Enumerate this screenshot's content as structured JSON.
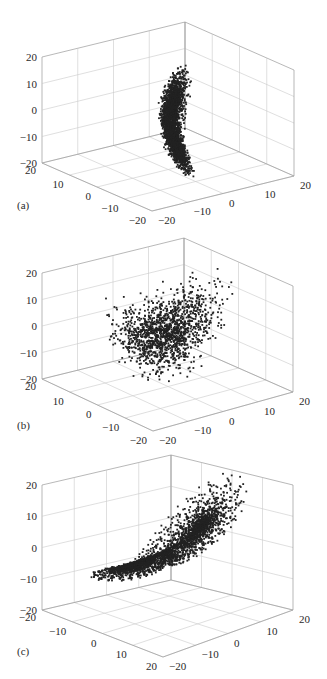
{
  "figure": {
    "panel_count": 3,
    "dot_color": "#222222",
    "grid_color": "#c9c9c9",
    "text_color": "#2a2a2a"
  },
  "chart_data": [
    {
      "type": "scatter",
      "subtype": "3d-scatter",
      "panel_label": "(a)",
      "title": "",
      "description": "Narrow, nearly vertical figure-eight point cloud (attractor viewed edge-on), two lobes stacked along z",
      "xlim": [
        -20,
        20
      ],
      "ylim": [
        -20,
        20
      ],
      "zlim": [
        -20,
        20
      ],
      "x_ticks": [
        -20,
        -10,
        0,
        10,
        20
      ],
      "y_ticks": [
        20,
        10,
        0,
        -10,
        -20
      ],
      "z_ticks": [
        20,
        10,
        0,
        -10,
        -20
      ],
      "left_axis_tick_labels": [
        "20",
        "10",
        "0",
        "−10",
        "−20"
      ],
      "right_axis_tick_labels": [
        "−20",
        "−10",
        "0",
        "10",
        "20"
      ],
      "z_axis_tick_labels": [
        "20",
        "10",
        "0",
        "−10",
        "−20"
      ],
      "grid": true,
      "shape": "figure-eight",
      "approx_extent": {
        "z": [
          -20,
          22
        ]
      }
    },
    {
      "type": "scatter",
      "subtype": "3d-scatter",
      "panel_label": "(b)",
      "title": "",
      "description": "Diffuse, noisy cloud of points spread roughly over x,z in [-20,15], no clear structure",
      "xlim": [
        -20,
        20
      ],
      "ylim": [
        -20,
        20
      ],
      "zlim": [
        -20,
        20
      ],
      "left_axis_tick_labels": [
        "20",
        "10",
        "0",
        "−10",
        "−20"
      ],
      "right_axis_tick_labels": [
        "−20",
        "−10",
        "0",
        "10",
        "20"
      ],
      "z_axis_tick_labels": [
        "20",
        "10",
        "0",
        "−10",
        "−20"
      ],
      "grid": true,
      "shape": "diffuse-cloud",
      "approx_extent": {
        "z": [
          -20,
          15
        ]
      }
    },
    {
      "type": "scatter",
      "subtype": "3d-scatter",
      "panel_label": "(c)",
      "title": "",
      "description": "Lorenz-style butterfly attractor: two lobes, left lobe centered near z=-8, right lobe centered near z=+10",
      "xlim": [
        -20,
        20
      ],
      "ylim": [
        -20,
        20
      ],
      "zlim": [
        -20,
        20
      ],
      "left_axis_tick_labels": [
        "−20",
        "−10",
        "0",
        "10",
        "20"
      ],
      "right_axis_tick_labels": [
        "−20",
        "−10",
        "0",
        "10",
        "20"
      ],
      "z_axis_tick_labels": [
        "20",
        "10",
        "0",
        "−10",
        "−20"
      ],
      "grid": true,
      "shape": "butterfly",
      "approx_extent": {
        "z": [
          -20,
          20
        ]
      }
    }
  ]
}
